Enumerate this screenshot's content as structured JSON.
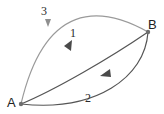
{
  "diagram": {
    "type": "directed-graph",
    "background_color": "#ffffff",
    "nodes": [
      {
        "id": "A",
        "label": "A",
        "x": 21,
        "y": 104,
        "dot_color": "#6e6e6e"
      },
      {
        "id": "B",
        "label": "B",
        "x": 148,
        "y": 32,
        "dot_color": "#6e6e6e"
      }
    ],
    "edges": [
      {
        "id": "1",
        "label": "1",
        "from": "A",
        "to": "B",
        "color": "#555555",
        "arrow_direction": "up-right",
        "path": "M 21 104 C 55 90, 110 58, 148 32"
      },
      {
        "id": "2",
        "label": "2",
        "from": "B",
        "to": "A",
        "color": "#555555",
        "arrow_direction": "down-left",
        "path": "M 148 32 C 145 78, 95 112, 21 104"
      },
      {
        "id": "3",
        "label": "3",
        "from": "B",
        "to": "A",
        "color": "#9a9a9a",
        "arrow_direction": "down-left",
        "path": "M 148 32 C 100 5, 45 2, 21 104"
      }
    ]
  }
}
